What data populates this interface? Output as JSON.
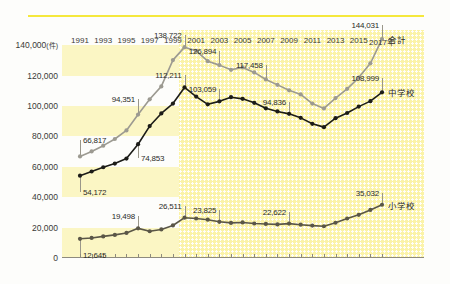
{
  "chart_data": {
    "type": "line",
    "title": "",
    "era_label": "2000年代➡",
    "xlabel": "",
    "ylabel": "",
    "yunit": "(件)",
    "ylim": [
      0,
      150000
    ],
    "yticks": [
      0,
      20000,
      40000,
      60000,
      80000,
      100000,
      120000,
      140000
    ],
    "ytick_labels": [
      "0",
      "20,000",
      "40,000",
      "60,000",
      "80,000",
      "100,000",
      "120,000",
      "140,000"
    ],
    "x": [
      1991,
      1992,
      1993,
      1994,
      1995,
      1996,
      1997,
      1998,
      1999,
      2000,
      2001,
      2002,
      2003,
      2004,
      2005,
      2006,
      2007,
      2008,
      2009,
      2010,
      2011,
      2012,
      2013,
      2014,
      2015,
      2016,
      2017
    ],
    "xtick_labels": [
      "1991",
      "1993",
      "1995",
      "1997",
      "1999",
      "2001",
      "2003",
      "2005",
      "2007",
      "2009",
      "2011",
      "2013",
      "2015",
      "2017年"
    ],
    "xtick_years": [
      1991,
      1993,
      1995,
      1997,
      1999,
      2001,
      2003,
      2005,
      2007,
      2009,
      2011,
      2013,
      2015,
      2017
    ],
    "xaxis_suffix": "年",
    "highlight_region": {
      "from": 2000,
      "to": 2017
    },
    "grid": "horizontal-bands",
    "legend_position": "right-inline",
    "series": [
      {
        "name": "合計",
        "color": "#9c9a91",
        "values": [
          66817,
          70100,
          73900,
          78300,
          83900,
          94351,
          104400,
          112900,
          130200,
          138722,
          136300,
          129500,
          126894,
          123800,
          125400,
          122100,
          117458,
          113900,
          110300,
          107600,
          101600,
          98400,
          105200,
          111300,
          118700,
          128100,
          144031
        ]
      },
      {
        "name": "中学校",
        "color": "#1c1c18",
        "values": [
          54172,
          56900,
          59700,
          62100,
          65400,
          74853,
          86800,
          95100,
          101600,
          112211,
          106200,
          101100,
          103059,
          105800,
          104700,
          102100,
          98500,
          96400,
          94836,
          92200,
          88300,
          86100,
          92000,
          95400,
          99600,
          103200,
          108999
        ]
      },
      {
        "name": "小学校",
        "color": "#5a5647",
        "values": [
          12645,
          13200,
          14200,
          15200,
          16500,
          19498,
          17600,
          18800,
          21400,
          26511,
          26000,
          25200,
          23825,
          23100,
          23400,
          22700,
          22400,
          22100,
          22622,
          21900,
          21300,
          20900,
          23200,
          26000,
          28400,
          31600,
          35032
        ]
      }
    ],
    "annotations": [
      {
        "text": "66,817",
        "year": 1991,
        "value": 66817,
        "series": "合計",
        "side": "right"
      },
      {
        "text": "94,351",
        "year": 1996,
        "value": 94351,
        "series": "合計",
        "side": "left"
      },
      {
        "text": "138,722",
        "year": 2000,
        "value": 138722,
        "series": "合計",
        "side": "left"
      },
      {
        "text": "126,894",
        "year": 2003,
        "value": 126894,
        "series": "合計",
        "side": "left"
      },
      {
        "text": "117,458",
        "year": 2007,
        "value": 117458,
        "series": "合計",
        "side": "left"
      },
      {
        "text": "144,031",
        "year": 2017,
        "value": 144031,
        "series": "合計",
        "side": "left"
      },
      {
        "text": "54,172",
        "year": 1991,
        "value": 54172,
        "series": "中学校",
        "side": "right"
      },
      {
        "text": "74,853",
        "year": 1996,
        "value": 74853,
        "series": "中学校",
        "side": "right"
      },
      {
        "text": "112,211",
        "year": 2000,
        "value": 112211,
        "series": "中学校",
        "side": "left"
      },
      {
        "text": "103,059",
        "year": 2003,
        "value": 103059,
        "series": "中学校",
        "side": "left"
      },
      {
        "text": "94,836",
        "year": 2009,
        "value": 94836,
        "series": "中学校",
        "side": "left"
      },
      {
        "text": "108,999",
        "year": 2017,
        "value": 108999,
        "series": "中学校",
        "side": "left"
      },
      {
        "text": "12,645",
        "year": 1991,
        "value": 12645,
        "series": "小学校",
        "side": "right"
      },
      {
        "text": "19,498",
        "year": 1996,
        "value": 19498,
        "series": "小学校",
        "side": "left"
      },
      {
        "text": "26,511",
        "year": 2000,
        "value": 26511,
        "series": "小学校",
        "side": "left"
      },
      {
        "text": "23,825",
        "year": 2003,
        "value": 23825,
        "series": "小学校",
        "side": "left"
      },
      {
        "text": "22,622",
        "year": 2009,
        "value": 22622,
        "series": "小学校",
        "side": "left"
      },
      {
        "text": "35,032",
        "year": 2017,
        "value": 35032,
        "series": "小学校",
        "side": "left"
      }
    ],
    "colors": {
      "band": "#fbf6c4",
      "dotted_region": "#fbf3a8",
      "rule": "#f5e83c",
      "axis": "#8d8a7e"
    }
  }
}
